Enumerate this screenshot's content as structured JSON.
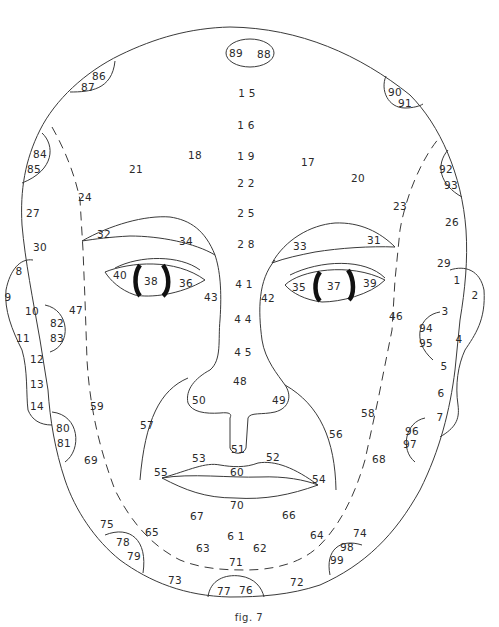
{
  "figure": {
    "caption": "fig. 7",
    "line_color": "#3a3a3a",
    "text_color": "#2a2a2a",
    "background": "#ffffff"
  },
  "labels": [
    {
      "id": "1",
      "text": "1",
      "x": 457,
      "y": 280
    },
    {
      "id": "2",
      "text": "2",
      "x": 475,
      "y": 295
    },
    {
      "id": "3",
      "text": "3",
      "x": 445,
      "y": 311
    },
    {
      "id": "4",
      "text": "4",
      "x": 459,
      "y": 339
    },
    {
      "id": "5",
      "text": "5",
      "x": 444,
      "y": 366
    },
    {
      "id": "6",
      "text": "6",
      "x": 441,
      "y": 393
    },
    {
      "id": "7",
      "text": "7",
      "x": 440,
      "y": 417
    },
    {
      "id": "8",
      "text": "8",
      "x": 19,
      "y": 271
    },
    {
      "id": "9",
      "text": "9",
      "x": 8,
      "y": 297
    },
    {
      "id": "10",
      "text": "10",
      "x": 32,
      "y": 311
    },
    {
      "id": "11",
      "text": "11",
      "x": 23,
      "y": 338
    },
    {
      "id": "12",
      "text": "12",
      "x": 37,
      "y": 359
    },
    {
      "id": "13",
      "text": "13",
      "x": 37,
      "y": 384
    },
    {
      "id": "14",
      "text": "14",
      "x": 37,
      "y": 406
    },
    {
      "id": "15",
      "text": "1 5",
      "x": 247,
      "y": 93
    },
    {
      "id": "16",
      "text": "1 6",
      "x": 246,
      "y": 125
    },
    {
      "id": "17",
      "text": "17",
      "x": 308,
      "y": 162
    },
    {
      "id": "18",
      "text": "18",
      "x": 195,
      "y": 155
    },
    {
      "id": "19",
      "text": "1 9",
      "x": 246,
      "y": 156
    },
    {
      "id": "20",
      "text": "20",
      "x": 358,
      "y": 178
    },
    {
      "id": "21",
      "text": "21",
      "x": 136,
      "y": 169
    },
    {
      "id": "22",
      "text": "2 2",
      "x": 246,
      "y": 183
    },
    {
      "id": "23",
      "text": "23",
      "x": 400,
      "y": 206
    },
    {
      "id": "24",
      "text": "24",
      "x": 85,
      "y": 197
    },
    {
      "id": "25",
      "text": "2 5",
      "x": 246,
      "y": 213
    },
    {
      "id": "26",
      "text": "26",
      "x": 452,
      "y": 222
    },
    {
      "id": "27",
      "text": "27",
      "x": 33,
      "y": 213
    },
    {
      "id": "28",
      "text": "2 8",
      "x": 246,
      "y": 244
    },
    {
      "id": "29",
      "text": "29",
      "x": 444,
      "y": 263
    },
    {
      "id": "30",
      "text": "30",
      "x": 40,
      "y": 247
    },
    {
      "id": "31",
      "text": "31",
      "x": 374,
      "y": 240
    },
    {
      "id": "32",
      "text": "32",
      "x": 104,
      "y": 234
    },
    {
      "id": "33",
      "text": "33",
      "x": 300,
      "y": 246
    },
    {
      "id": "34",
      "text": "34",
      "x": 186,
      "y": 241
    },
    {
      "id": "35",
      "text": "35",
      "x": 299,
      "y": 287
    },
    {
      "id": "36",
      "text": "36",
      "x": 186,
      "y": 283
    },
    {
      "id": "37",
      "text": "37",
      "x": 334,
      "y": 286
    },
    {
      "id": "38",
      "text": "38",
      "x": 151,
      "y": 281
    },
    {
      "id": "39",
      "text": "39",
      "x": 370,
      "y": 283
    },
    {
      "id": "40",
      "text": "40",
      "x": 120,
      "y": 275
    },
    {
      "id": "41",
      "text": "4 1",
      "x": 244,
      "y": 284
    },
    {
      "id": "42",
      "text": "42",
      "x": 268,
      "y": 298
    },
    {
      "id": "43",
      "text": "43",
      "x": 211,
      "y": 297
    },
    {
      "id": "44",
      "text": "4 4",
      "x": 243,
      "y": 319
    },
    {
      "id": "45",
      "text": "4 5",
      "x": 243,
      "y": 352
    },
    {
      "id": "46",
      "text": "46",
      "x": 396,
      "y": 316
    },
    {
      "id": "47",
      "text": "47",
      "x": 76,
      "y": 310
    },
    {
      "id": "48",
      "text": "48",
      "x": 240,
      "y": 381
    },
    {
      "id": "49",
      "text": "49",
      "x": 279,
      "y": 400
    },
    {
      "id": "50",
      "text": "50",
      "x": 199,
      "y": 400
    },
    {
      "id": "51",
      "text": "51",
      "x": 238,
      "y": 449
    },
    {
      "id": "52",
      "text": "52",
      "x": 273,
      "y": 457
    },
    {
      "id": "53",
      "text": "53",
      "x": 199,
      "y": 458
    },
    {
      "id": "54",
      "text": "54",
      "x": 319,
      "y": 479
    },
    {
      "id": "55",
      "text": "55",
      "x": 161,
      "y": 472
    },
    {
      "id": "56",
      "text": "56",
      "x": 336,
      "y": 434
    },
    {
      "id": "57",
      "text": "57",
      "x": 147,
      "y": 425
    },
    {
      "id": "58",
      "text": "58",
      "x": 368,
      "y": 413
    },
    {
      "id": "59",
      "text": "59",
      "x": 97,
      "y": 406
    },
    {
      "id": "60",
      "text": "60",
      "x": 237,
      "y": 472
    },
    {
      "id": "61",
      "text": "6 1",
      "x": 236,
      "y": 536
    },
    {
      "id": "62",
      "text": "62",
      "x": 260,
      "y": 548
    },
    {
      "id": "63",
      "text": "63",
      "x": 203,
      "y": 548
    },
    {
      "id": "64",
      "text": "64",
      "x": 317,
      "y": 535
    },
    {
      "id": "65",
      "text": "65",
      "x": 152,
      "y": 532
    },
    {
      "id": "66",
      "text": "66",
      "x": 289,
      "y": 515
    },
    {
      "id": "67",
      "text": "67",
      "x": 197,
      "y": 516
    },
    {
      "id": "68",
      "text": "68",
      "x": 379,
      "y": 459
    },
    {
      "id": "69",
      "text": "69",
      "x": 91,
      "y": 460
    },
    {
      "id": "70",
      "text": "70",
      "x": 237,
      "y": 505
    },
    {
      "id": "71",
      "text": "71",
      "x": 236,
      "y": 562
    },
    {
      "id": "72",
      "text": "72",
      "x": 297,
      "y": 582
    },
    {
      "id": "73",
      "text": "73",
      "x": 175,
      "y": 580
    },
    {
      "id": "74",
      "text": "74",
      "x": 360,
      "y": 533
    },
    {
      "id": "75",
      "text": "75",
      "x": 107,
      "y": 524
    },
    {
      "id": "76",
      "text": "76",
      "x": 246,
      "y": 590
    },
    {
      "id": "77",
      "text": "77",
      "x": 224,
      "y": 591
    },
    {
      "id": "78",
      "text": "78",
      "x": 123,
      "y": 542
    },
    {
      "id": "79",
      "text": "79",
      "x": 134,
      "y": 556
    },
    {
      "id": "80",
      "text": "80",
      "x": 63,
      "y": 428
    },
    {
      "id": "81",
      "text": "81",
      "x": 64,
      "y": 443
    },
    {
      "id": "82",
      "text": "82",
      "x": 57,
      "y": 323
    },
    {
      "id": "83",
      "text": "83",
      "x": 57,
      "y": 338
    },
    {
      "id": "84",
      "text": "84",
      "x": 40,
      "y": 154
    },
    {
      "id": "85",
      "text": "85",
      "x": 34,
      "y": 169
    },
    {
      "id": "86",
      "text": "86",
      "x": 99,
      "y": 76
    },
    {
      "id": "87",
      "text": "87",
      "x": 88,
      "y": 87
    },
    {
      "id": "88",
      "text": "88",
      "x": 264,
      "y": 54
    },
    {
      "id": "89",
      "text": "89",
      "x": 236,
      "y": 53
    },
    {
      "id": "90",
      "text": "90",
      "x": 395,
      "y": 92
    },
    {
      "id": "91",
      "text": "91",
      "x": 405,
      "y": 103
    },
    {
      "id": "92",
      "text": "92",
      "x": 446,
      "y": 169
    },
    {
      "id": "93",
      "text": "93",
      "x": 451,
      "y": 185
    },
    {
      "id": "94",
      "text": "94",
      "x": 426,
      "y": 328
    },
    {
      "id": "95",
      "text": "95",
      "x": 426,
      "y": 343
    },
    {
      "id": "96",
      "text": "96",
      "x": 412,
      "y": 431
    },
    {
      "id": "97",
      "text": "97",
      "x": 410,
      "y": 444
    },
    {
      "id": "98",
      "text": "98",
      "x": 347,
      "y": 547
    },
    {
      "id": "99",
      "text": "99",
      "x": 337,
      "y": 560
    }
  ]
}
